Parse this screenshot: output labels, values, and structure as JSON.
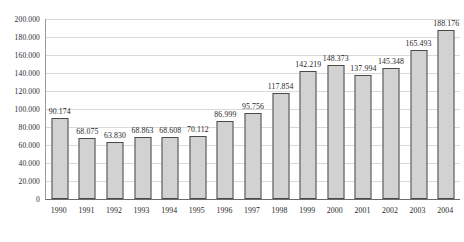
{
  "chart_data": {
    "type": "bar",
    "title": "",
    "subtitle": "",
    "xlabel": "",
    "ylabel": "",
    "grid": true,
    "legend": false,
    "ylim": [
      0,
      200
    ],
    "y_ticks": [
      "0",
      "20.000",
      "40.000",
      "60.000",
      "80.000",
      "100.000",
      "120.000",
      "140.000",
      "160.000",
      "180.000",
      "200.000"
    ],
    "y_tick_values": [
      0,
      20,
      40,
      60,
      80,
      100,
      120,
      140,
      160,
      180,
      200
    ],
    "categories": [
      "1990",
      "1991",
      "1992",
      "1993",
      "1994",
      "1995",
      "1996",
      "1997",
      "1998",
      "1999",
      "2000",
      "2001",
      "2002",
      "2003",
      "2004"
    ],
    "values": [
      90.174,
      68.075,
      63.83,
      68.863,
      68.608,
      70.112,
      86.999,
      95.756,
      117.854,
      142.219,
      148.373,
      137.994,
      145.348,
      165.493,
      188.176
    ],
    "data_labels": [
      "90.174",
      "68.075",
      "63.830",
      "68.863",
      "68.608",
      "70.112",
      "86.999",
      "95.756",
      "117.854",
      "142.219",
      "148.373",
      "137.994",
      "145.348",
      "165.493",
      "188.176"
    ],
    "colors": {
      "bar_fill": "#d2d2d2",
      "bar_border": "#4a4a4a",
      "gridline": "#d9d9d9",
      "axis": "#6b6b6b",
      "text": "#1f1f1f",
      "background": "#ffffff"
    }
  }
}
